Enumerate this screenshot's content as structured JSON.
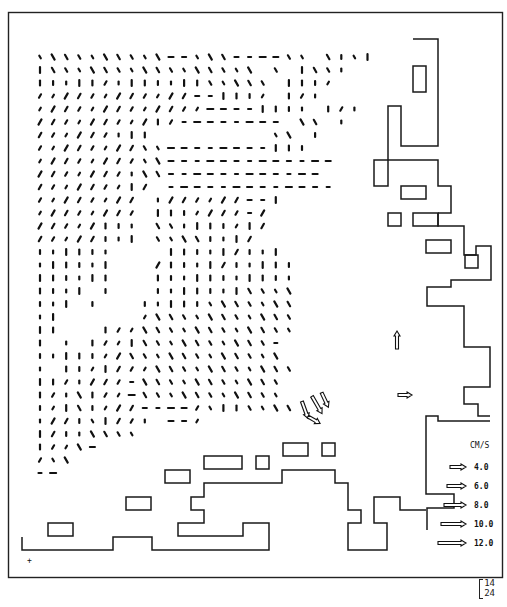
{
  "figure": {
    "type": "current-vector-field-map",
    "units_label": "CM/S",
    "corner_label": {
      "top": "14",
      "bottom": "24"
    },
    "origin_marker": "+"
  },
  "legend": {
    "title": "CM/S",
    "entries": [
      {
        "label": "4.0",
        "speed": 4.0
      },
      {
        "label": "6.0",
        "speed": 6.0
      },
      {
        "label": "8.0",
        "speed": 8.0
      },
      {
        "label": "10.0",
        "speed": 10.0
      },
      {
        "label": "12.0",
        "speed": 12.0
      }
    ]
  },
  "colors": {
    "ink": "#111111",
    "background": "#ffffff"
  },
  "grid": {
    "x0": 40,
    "y0": 57,
    "dx": 13.1,
    "dy": 13.0,
    "cols": 26,
    "rows": 33
  },
  "vector_field": {
    "note": "Each row string encodes direction per column: chars map to angles; '.' = no vector",
    "rows": [
      "\\\\\\\\\\\\\\\\\\\\--\\\\\\----\\\\.\\|\\|",
      "|\\\\\\\\\\\\\\\\\\\\\\\\\\\\\\\\.\\.|\\\\|",
      "|||||/|||||||\\\\\\\\\\.|||/",
      "////////////--|||/.|/|",
      "/////////////----||||.|/|",
      "/////////|/--------.\\\\.|",
      "//////|||.........\\\\.|",
      "////////\\\\--------|||",
      "////////\\\\-------------",
      "///////|\\\\------------",
      "///////|/.-------------",
      "////////.|//////--|",
      "////////.|||////-/",
      "/////|||.\\\\||||/|/",
      "/////|||.\\\\\\\\|||/",
      "||||||.. .|||||/|||",
      "||||||.. /||||/|||||",
      "||||||...|||||||||||",
      "||||.|...|||||||\\\\\\\\",
      "|||.|...|||||\\\\\\\\\\\\\\",
      "||....../\\\\\\\\\\\\\\\\\\\\\\",
      "||...|//\\\\\\\\\\\\\\\\\\\\\\\\",
      "|.|.|//|\\\\\\\\\\\\\\\\\\\\-",
      "|||||//\\\\\\\\\\\\\\\\\\\\\\\\",
      "|.||/|///\\\\\\\\\\\\\\\\\\\\\\",
      "||/|///-\\\\\\\\\\\\\\\\\\\\\\",
      "|/|\\|//-\\\\\\\\\\\\\\\\\\\\\\",
      "|/|\\|///----/\\||\\\\\\\\",
      "|//|\\|//|.--/",
      "|/||\\\\\\\\",
      "|//\\-",
      "/\\\\",
      "--"
    ]
  },
  "special_vectors": [
    {
      "x": 397,
      "y": 340,
      "angle": -90,
      "len": 18,
      "open": true
    },
    {
      "x": 405,
      "y": 395,
      "angle": 0,
      "len": 14,
      "open": true
    },
    {
      "x": 305,
      "y": 410,
      "angle": 70,
      "len": 18,
      "open": true
    },
    {
      "x": 317,
      "y": 405,
      "angle": 60,
      "len": 20,
      "open": true
    },
    {
      "x": 325,
      "y": 400,
      "angle": 65,
      "len": 16,
      "open": true
    },
    {
      "x": 314,
      "y": 420,
      "angle": 30,
      "len": 14,
      "open": true
    }
  ]
}
